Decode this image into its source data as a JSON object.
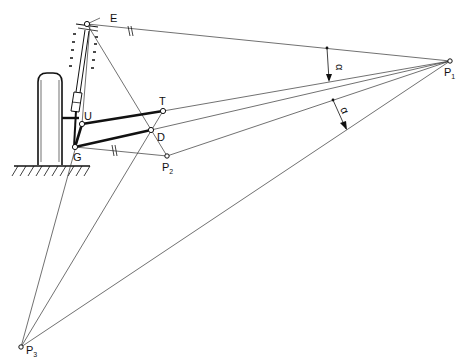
{
  "figure": {
    "type": "suspension-kinematics-diagram"
  },
  "points": {
    "E": {
      "label": "E",
      "x": 87,
      "y": 24
    },
    "U": {
      "label": "U",
      "x": 82,
      "y": 124
    },
    "T": {
      "label": "T",
      "x": 163,
      "y": 111
    },
    "D": {
      "label": "D",
      "x": 151,
      "y": 130
    },
    "G": {
      "label": "G",
      "x": 75,
      "y": 147
    },
    "P1": {
      "label": "P",
      "sub": "1",
      "x": 450,
      "y": 61
    },
    "P2": {
      "label": "P",
      "sub": "2",
      "x": 167,
      "y": 156
    },
    "P3": {
      "label": "P",
      "sub": "3",
      "x": 21,
      "y": 347
    }
  },
  "labels": {
    "E": "E",
    "U": "U",
    "T": "T",
    "D": "D",
    "G": "G",
    "P1_main": "P",
    "P1_sub": "1",
    "P2_main": "P",
    "P2_sub": "2",
    "P3_main": "P",
    "P3_sub": "3",
    "angle_1": "α",
    "angle_2": "α",
    "parallel_mark_1": "//",
    "parallel_mark_2": "//"
  },
  "colors": {
    "line": "#333333",
    "link": "#111111",
    "background": "#ffffff"
  }
}
